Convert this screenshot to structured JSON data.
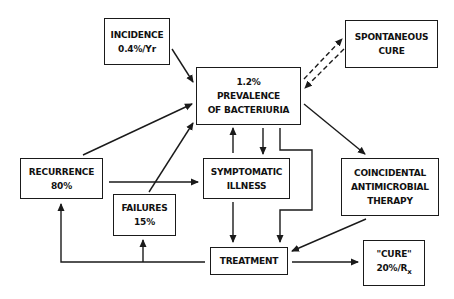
{
  "diagram": {
    "nodes": {
      "incidence": {
        "line1": "INCIDENCE",
        "line2": "0.4%/Yr"
      },
      "prevalence": {
        "line1": "1.2%",
        "line2": "PREVALENCE",
        "line3": "OF BACTERIURIA"
      },
      "spontaneous": {
        "line1": "SPONTANEOUS",
        "line2": "CURE"
      },
      "recurrence": {
        "line1": "RECURRENCE",
        "line2": "80%"
      },
      "symptomatic": {
        "line1": "SYMPTOMATIC",
        "line2": "ILLNESS"
      },
      "coincidental": {
        "line1": "COINCIDENTAL",
        "line2": "ANTIMICROBIAL",
        "line3": "THERAPY"
      },
      "failures": {
        "line1": "FAILURES",
        "line2": "15%"
      },
      "treatment": {
        "line1": "TREATMENT"
      },
      "cure": {
        "line1": "\"CURE\"",
        "line2": "20%/R",
        "line2_sub": "x"
      }
    },
    "edges": [
      {
        "from": "incidence",
        "to": "prevalence",
        "style": "solid"
      },
      {
        "from": "prevalence",
        "to": "spontaneous",
        "style": "dashed"
      },
      {
        "from": "spontaneous",
        "to": "prevalence",
        "style": "dashed"
      },
      {
        "from": "recurrence",
        "to": "prevalence",
        "style": "solid"
      },
      {
        "from": "failures",
        "to": "prevalence",
        "style": "solid"
      },
      {
        "from": "symptomatic",
        "to": "prevalence",
        "style": "solid"
      },
      {
        "from": "prevalence",
        "to": "symptomatic",
        "style": "solid"
      },
      {
        "from": "prevalence",
        "to": "treatment",
        "style": "solid"
      },
      {
        "from": "prevalence",
        "to": "coincidental",
        "style": "solid"
      },
      {
        "from": "recurrence",
        "to": "symptomatic",
        "style": "solid"
      },
      {
        "from": "symptomatic",
        "to": "treatment",
        "style": "solid"
      },
      {
        "from": "coincidental",
        "to": "treatment",
        "style": "solid"
      },
      {
        "from": "treatment",
        "to": "cure",
        "style": "solid"
      },
      {
        "from": "treatment",
        "to": "recurrence",
        "style": "solid"
      },
      {
        "from": "treatment",
        "to": "failures",
        "style": "solid"
      }
    ],
    "colors": {
      "ink": "#1a1a1a",
      "background": "#ffffff"
    }
  }
}
